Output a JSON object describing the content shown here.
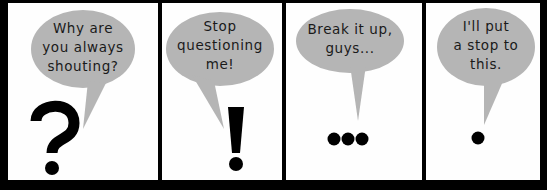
{
  "comic": {
    "colors": {
      "border": "#000000",
      "panel_bg": "#fefefe",
      "bubble": "#b5b5b5",
      "text": "#1a1a1a"
    },
    "panels": [
      {
        "speech_lines": [
          "Why are",
          "you always",
          "shouting?"
        ],
        "symbol": "?",
        "symbol_name": "question-mark"
      },
      {
        "speech_lines": [
          "Stop",
          "questioning",
          "me!"
        ],
        "symbol": "!",
        "symbol_name": "exclamation-mark"
      },
      {
        "speech_lines": [
          "Break it up,",
          "guys..."
        ],
        "symbol": "...",
        "symbol_name": "ellipsis"
      },
      {
        "speech_lines": [
          "I'll put",
          "a stop to",
          "this."
        ],
        "symbol": ".",
        "symbol_name": "period"
      }
    ]
  }
}
